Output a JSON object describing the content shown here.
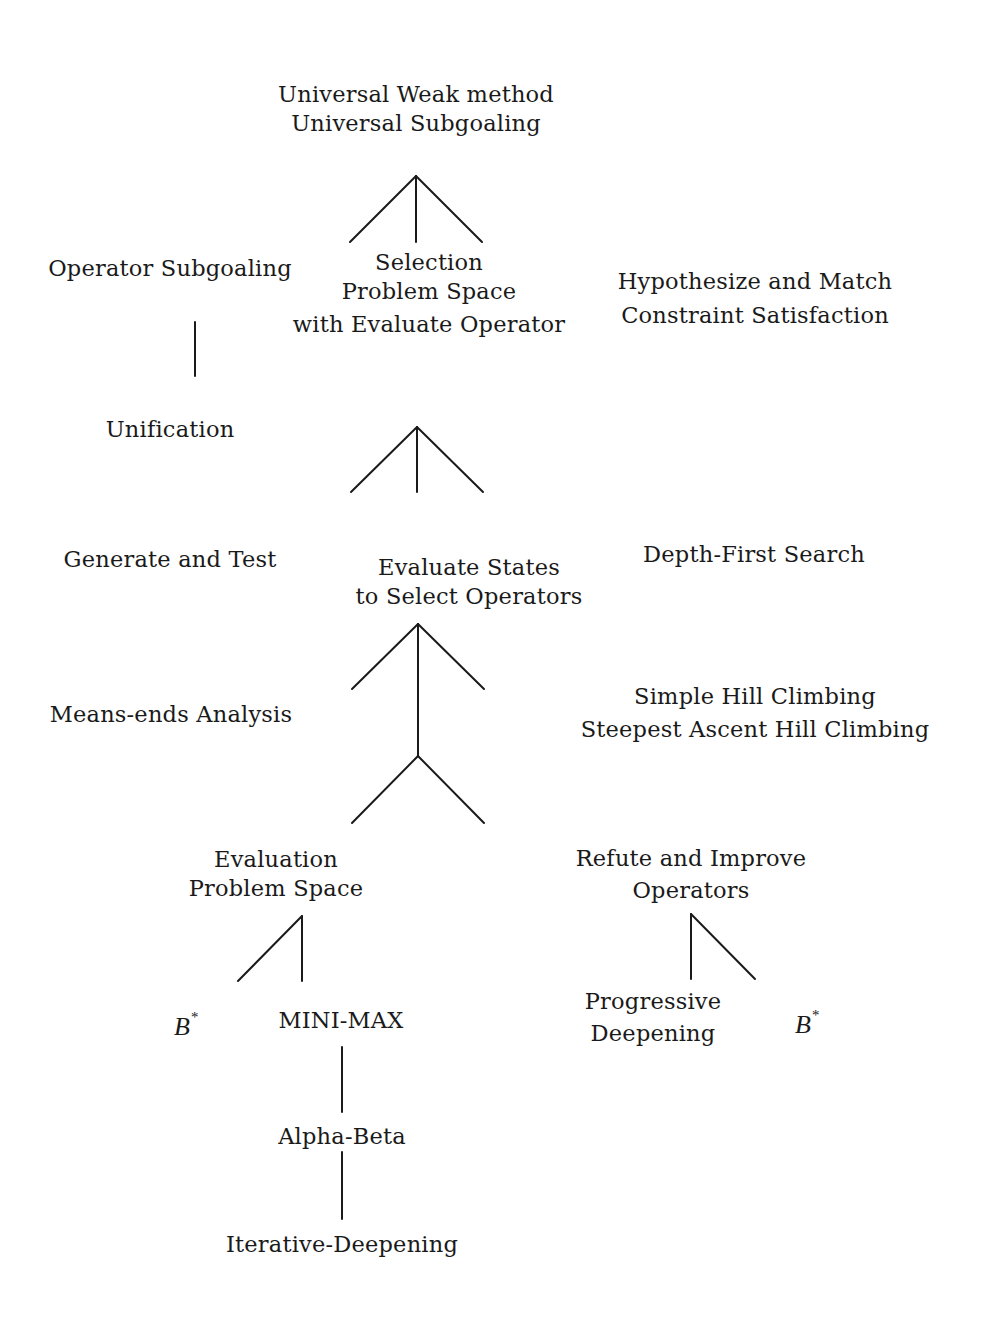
{
  "diagram": {
    "nodes": {
      "universal": {
        "lines": [
          "Universal Weak method",
          "Universal Subgoaling"
        ]
      },
      "operator_subgoaling": {
        "lines": [
          "Operator Subgoaling"
        ]
      },
      "selection_problem_space": {
        "lines": [
          "Selection",
          "Problem Space",
          "with Evaluate Operator"
        ]
      },
      "hypothesize_match": {
        "lines": [
          "Hypothesize and Match",
          "Constraint Satisfaction"
        ]
      },
      "unification": {
        "lines": [
          "Unification"
        ]
      },
      "generate_test": {
        "lines": [
          "Generate and Test"
        ]
      },
      "evaluate_states": {
        "lines": [
          "Evaluate States",
          "to Select Operators"
        ]
      },
      "depth_first": {
        "lines": [
          "Depth-First Search"
        ]
      },
      "means_ends": {
        "lines": [
          "Means-ends Analysis"
        ]
      },
      "hill_climbing": {
        "lines": [
          "Simple Hill Climbing",
          "Steepest Ascent Hill Climbing"
        ]
      },
      "evaluation_problem_space": {
        "lines": [
          "Evaluation",
          "Problem Space"
        ]
      },
      "refute_improve": {
        "lines": [
          "Refute and Improve",
          "Operators"
        ]
      },
      "b_star_left": {
        "base": "B",
        "sup": "*"
      },
      "mini_max": {
        "lines": [
          "MINI-MAX"
        ]
      },
      "progressive_deepening": {
        "lines": [
          "Progressive",
          "Deepening"
        ]
      },
      "b_star_right": {
        "base": "B",
        "sup": "*"
      },
      "alpha_beta": {
        "lines": [
          "Alpha-Beta"
        ]
      },
      "iterative_deepening": {
        "lines": [
          "Iterative-Deepening"
        ]
      }
    },
    "edges": [
      {
        "from": "universal",
        "to": "operator_subgoaling"
      },
      {
        "from": "universal",
        "to": "selection_problem_space"
      },
      {
        "from": "universal",
        "to": "hypothesize_match"
      },
      {
        "from": "operator_subgoaling",
        "to": "unification"
      },
      {
        "from": "selection_problem_space",
        "to": "generate_test"
      },
      {
        "from": "selection_problem_space",
        "to": "evaluate_states"
      },
      {
        "from": "selection_problem_space",
        "to": "depth_first"
      },
      {
        "from": "evaluate_states",
        "to": "means_ends"
      },
      {
        "from": "evaluate_states",
        "to": "hill_climbing"
      },
      {
        "from": "evaluate_states",
        "to": "evaluation_problem_space"
      },
      {
        "from": "evaluate_states",
        "to": "refute_improve"
      },
      {
        "from": "evaluation_problem_space",
        "to": "b_star_left"
      },
      {
        "from": "evaluation_problem_space",
        "to": "mini_max"
      },
      {
        "from": "refute_improve",
        "to": "progressive_deepening"
      },
      {
        "from": "refute_improve",
        "to": "b_star_right"
      },
      {
        "from": "mini_max",
        "to": "alpha_beta"
      },
      {
        "from": "alpha_beta",
        "to": "iterative_deepening"
      }
    ]
  }
}
